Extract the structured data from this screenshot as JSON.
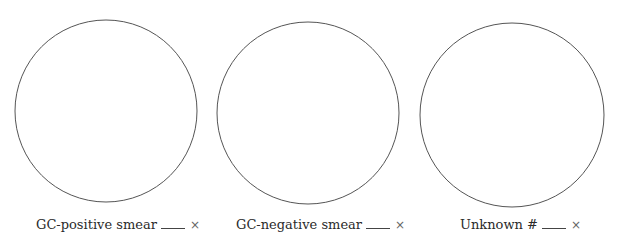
{
  "panels": [
    {
      "label": "GC-positive smear",
      "suffix": "×",
      "circle": {
        "cx": 106,
        "cy": 111,
        "r": 91
      }
    },
    {
      "label": "GC-negative smear",
      "suffix": "×",
      "circle": {
        "cx": 308,
        "cy": 113,
        "r": 91
      }
    },
    {
      "label": "Unknown #",
      "suffix": "×",
      "circle": {
        "cx": 512,
        "cy": 115,
        "r": 92
      }
    }
  ],
  "colors": {
    "stroke": "#555555",
    "text": "#2a2a2a"
  }
}
